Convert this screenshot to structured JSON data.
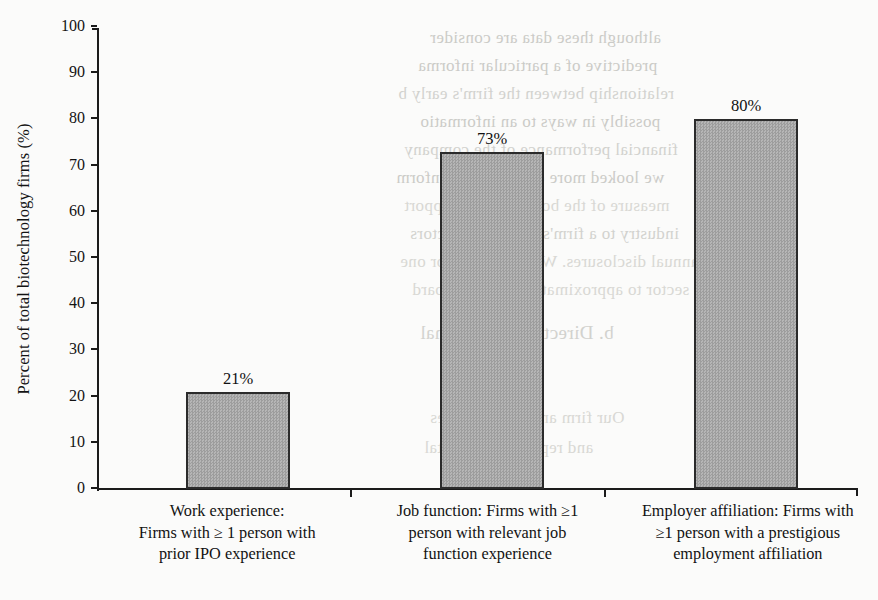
{
  "chart_data": {
    "type": "bar",
    "title": "",
    "subtitle": "",
    "xlabel": "",
    "ylabel": "Percent of total biotechnology firms (%)",
    "ylim": [
      0,
      100
    ],
    "ytick_labels": [
      "0",
      "10",
      "20",
      "30",
      "40",
      "50",
      "60",
      "70",
      "80",
      "90",
      "100"
    ],
    "ytick_values": [
      0,
      10,
      20,
      30,
      40,
      50,
      60,
      70,
      80,
      90,
      100
    ],
    "grid": false,
    "legend": false,
    "legend_position": "none",
    "bar_fill_color": "#a9a9a9",
    "bar_edge_color": "#2b2b2b",
    "categories": [
      "Work experience:\nFirms with ≥ 1 person with\nprior IPO experience",
      "Job function: Firms with ≥1\nperson with relevant job\nfunction experience",
      "Employer affiliation: Firms with\n≥1 person with a prestigious\nemployment affiliation"
    ],
    "category_lines": [
      [
        "Work experience:",
        "Firms with ≥ 1 person with",
        "prior IPO experience"
      ],
      [
        "Job function: Firms with ≥1",
        "person with relevant job",
        "function experience"
      ],
      [
        "Employer affiliation: Firms with",
        "≥1 person with a prestigious",
        "employment affiliation"
      ]
    ],
    "values": [
      21,
      73,
      80
    ],
    "data_labels": [
      "21%",
      "73%",
      "80%"
    ]
  },
  "background_bleed": {
    "lines": [
      {
        "text": "although these data are consider",
        "x": 430,
        "y": 28
      },
      {
        "text": "predictive of a particular informa",
        "x": 418,
        "y": 56
      },
      {
        "text": "relationship between the firm's early b",
        "x": 398,
        "y": 84
      },
      {
        "text": "possibly in ways to an informatio",
        "x": 420,
        "y": 112
      },
      {
        "text": "financial performance of the company",
        "x": 404,
        "y": 140
      },
      {
        "text": "we looked more closely at the inform",
        "x": 396,
        "y": 168
      },
      {
        "text": "measure of the board and past apport",
        "x": 404,
        "y": 196
      },
      {
        "text": "industry to a firm's board of directors",
        "x": 410,
        "y": 224
      },
      {
        "text": "annual disclosures. We found that for one",
        "x": 400,
        "y": 252
      },
      {
        "text": "sector to approximately the firm board",
        "x": 412,
        "y": 280
      },
      {
        "text": "b. Director Reputational",
        "x": 420,
        "y": 322
      },
      {
        "text": "Our firm analysis indicates",
        "x": 430,
        "y": 408
      },
      {
        "text": "and reputational capital",
        "x": 424,
        "y": 438
      }
    ]
  }
}
